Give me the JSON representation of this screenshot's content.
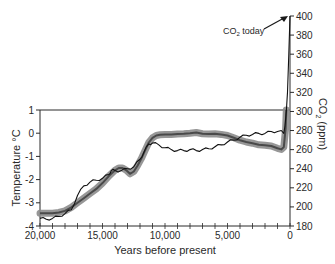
{
  "chart_data": {
    "type": "line",
    "title": "",
    "xlabel": "Years before present",
    "ylabel_left": "Temperature °C",
    "ylabel_right": "CO2 (ppm)",
    "ylabel_right_parts": {
      "base": "CO",
      "sub": "2",
      "rest": " (ppm)"
    },
    "annotation": {
      "base": "CO",
      "sub": "2",
      "rest": " today",
      "points_to": {
        "x": 0,
        "co2": 400
      }
    },
    "xlim": [
      20000,
      0
    ],
    "ylim_left": [
      -4,
      1
    ],
    "ylim_right": [
      180,
      400
    ],
    "x_ticks": [
      20000,
      15000,
      10000,
      5000,
      0
    ],
    "x_tick_labels": [
      "20,000",
      "15,000",
      "10,000",
      "5,000",
      "0"
    ],
    "x_minor_step": 1000,
    "y_left_ticks": [
      1,
      0,
      -1,
      -2,
      -3,
      -4
    ],
    "y_left_tick_labels": [
      "1",
      "0",
      "-1",
      "-2",
      "-3",
      "-4"
    ],
    "y_right_ticks": [
      400,
      380,
      360,
      340,
      320,
      300,
      280,
      260,
      240,
      220,
      200,
      180
    ],
    "y_right_tick_labels": [
      "400",
      "380",
      "360",
      "340",
      "320",
      "300",
      "280",
      "260",
      "240",
      "220",
      "200",
      "180"
    ],
    "grid": false,
    "legend": null,
    "series": [
      {
        "name": "Temperature",
        "axis": "left",
        "style": "thick gray band with dark center line",
        "color": "#7a7a7a",
        "x": [
          20000,
          19500,
          19000,
          18500,
          18000,
          17500,
          17000,
          16500,
          16000,
          15500,
          15000,
          14500,
          14000,
          13700,
          13400,
          13100,
          12800,
          12500,
          12200,
          11900,
          11600,
          11300,
          11000,
          10700,
          10400,
          10000,
          9500,
          9000,
          8500,
          8000,
          7500,
          7000,
          6500,
          6000,
          5500,
          5000,
          4500,
          4000,
          3500,
          3000,
          2500,
          2000,
          1500,
          1000,
          700,
          500,
          350,
          300
        ],
        "values": [
          -3.45,
          -3.45,
          -3.45,
          -3.42,
          -3.35,
          -3.2,
          -3.0,
          -2.8,
          -2.6,
          -2.4,
          -2.15,
          -1.85,
          -1.6,
          -1.5,
          -1.5,
          -1.6,
          -1.75,
          -1.65,
          -1.4,
          -1.1,
          -0.75,
          -0.4,
          -0.2,
          -0.1,
          -0.07,
          -0.05,
          -0.05,
          -0.03,
          -0.02,
          0.0,
          0.03,
          -0.02,
          -0.03,
          -0.02,
          -0.05,
          -0.1,
          -0.2,
          -0.3,
          -0.38,
          -0.43,
          -0.5,
          -0.52,
          -0.55,
          -0.65,
          -0.7,
          -0.6,
          0.2,
          1.0
        ]
      },
      {
        "name": "CO2",
        "axis": "right",
        "style": "thin black line",
        "color": "#1a1a1a",
        "x": [
          20000,
          19500,
          19000,
          18500,
          18000,
          17500,
          17000,
          16500,
          16000,
          15500,
          15000,
          14500,
          14300,
          14000,
          13500,
          13000,
          12500,
          12000,
          11700,
          11300,
          11000,
          10500,
          10000,
          9500,
          9000,
          8500,
          8000,
          7500,
          7000,
          6500,
          6000,
          5500,
          5000,
          4500,
          4000,
          3500,
          3000,
          2500,
          2000,
          1500,
          1000,
          700,
          500,
          400,
          300,
          200,
          100,
          0
        ],
        "values": [
          188,
          187,
          188,
          190,
          193,
          197,
          212,
          222,
          226,
          228,
          230,
          234,
          238,
          238,
          238,
          240,
          242,
          250,
          257,
          266,
          267,
          265,
          262,
          260,
          259,
          259,
          260,
          259,
          260,
          261,
          263,
          265,
          268,
          270,
          273,
          275,
          276,
          277,
          277,
          279,
          279,
          280,
          277,
          285,
          300,
          320,
          360,
          400
        ]
      }
    ]
  }
}
